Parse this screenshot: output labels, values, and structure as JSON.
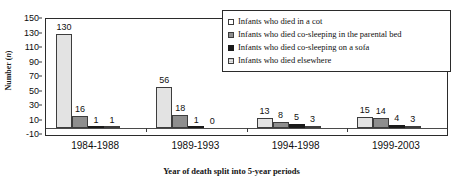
{
  "chart_data": {
    "type": "bar",
    "title": "",
    "xlabel": "Year of death split into 5-year periods",
    "ylabel": "Number (n)",
    "ylabel_main": "Number (",
    "ylabel_italic": "n",
    "ylabel_close": ")",
    "categories": [
      "1984-1988",
      "1989-1993",
      "1994-1998",
      "1999-2003"
    ],
    "series": [
      {
        "name": "Infants who died in a cot",
        "color": "#e3e3e3",
        "values": [
          130,
          56,
          13,
          15
        ]
      },
      {
        "name": "Infants who died co-sleeping in the parental bed",
        "color": "#8e8e8e",
        "values": [
          16,
          18,
          8,
          14
        ]
      },
      {
        "name": "Infants who died co-sleeping on a sofa",
        "color": "#1a1a1a",
        "values": [
          1,
          1,
          5,
          4
        ]
      },
      {
        "name": "Infants who died elsewhere",
        "color": "#c9c9c9",
        "values": [
          1,
          0,
          3,
          3
        ]
      }
    ],
    "ylim": [
      -10,
      150
    ],
    "yticks": [
      150,
      130,
      110,
      90,
      70,
      50,
      30,
      10,
      -10
    ],
    "ytick_labels": [
      "150",
      "130",
      "110",
      "90",
      "70",
      "50",
      "30",
      "10",
      "-10"
    ],
    "grid": false,
    "legend_position": "top-right-inside",
    "bar_value_labels": true
  }
}
